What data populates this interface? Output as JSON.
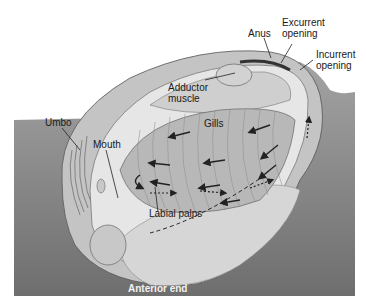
{
  "diagram": {
    "labels": {
      "anus": "Anus",
      "excurrent_1": "Excurrent",
      "excurrent_2": "opening",
      "incurrent_1": "Incurrent",
      "incurrent_2": "opening",
      "adductor_1": "Adductor",
      "adductor_2": "muscle",
      "gills": "Gills",
      "umbo": "Umbo",
      "mouth": "Mouth",
      "labial_palps": "Labial palps",
      "anterior_end": "Anterior end"
    },
    "colors": {
      "sediment": "#8a8a8a",
      "shell": "#c4c4c4",
      "mantle": "#e6e6e6",
      "gill": "#b8b8b8",
      "foot": "#d6d6d6",
      "line": "#222222"
    }
  }
}
